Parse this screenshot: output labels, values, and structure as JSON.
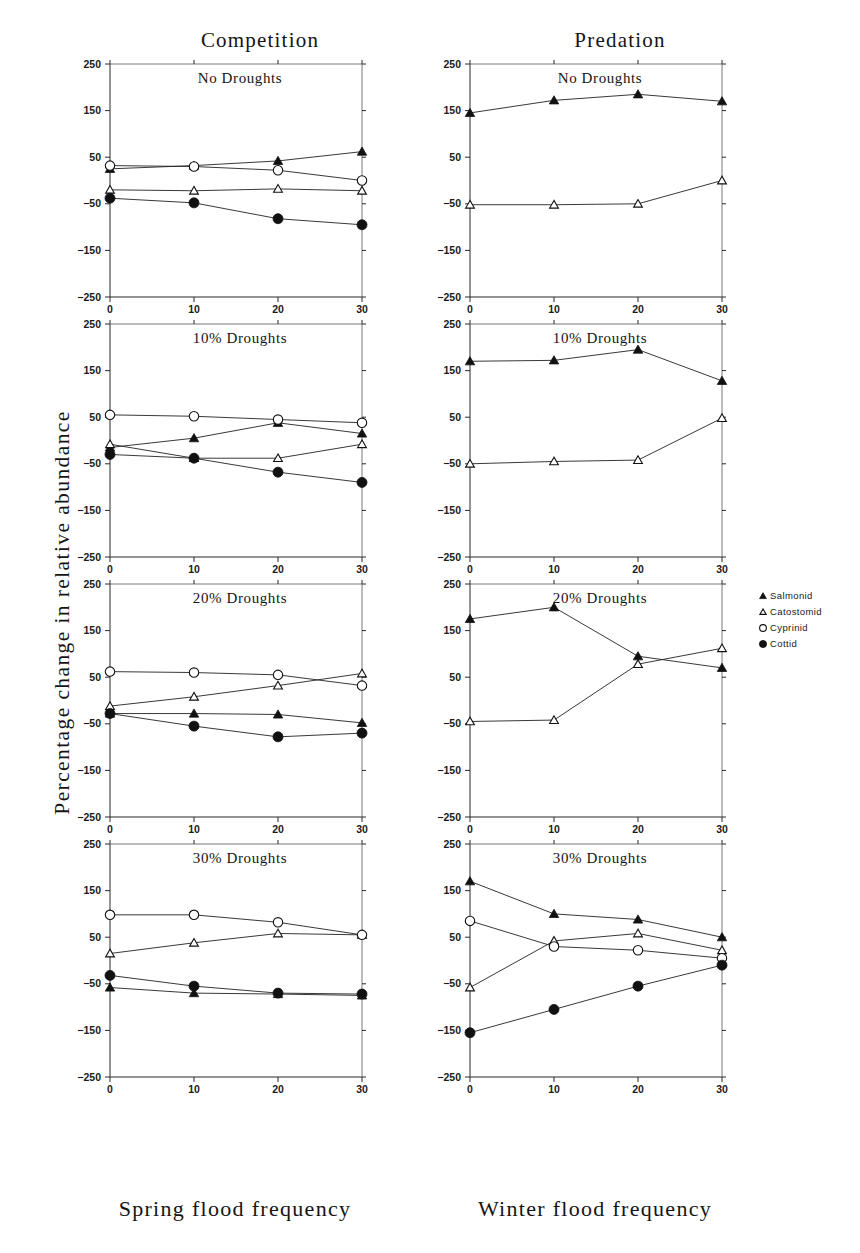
{
  "figure": {
    "y_axis_label": "Percentage change in relative abundance",
    "columns": [
      {
        "title": "Competition",
        "x_axis_label": "Spring flood frequency"
      },
      {
        "title": "Predation",
        "x_axis_label": "Winter flood frequency"
      }
    ]
  },
  "legend": {
    "position": "right-middle",
    "entries": [
      {
        "label": "Salmonid",
        "marker": "filled-triangle-icon"
      },
      {
        "label": "Catostomid",
        "marker": "open-triangle-icon"
      },
      {
        "label": "Cyprinid",
        "marker": "open-circle-icon"
      },
      {
        "label": "Cottid",
        "marker": "filled-circle-icon"
      }
    ]
  },
  "chart_data": [
    {
      "type": "line",
      "panel_id": "competition-no-droughts",
      "title": "No Droughts",
      "column": "Competition",
      "xlabel": "Spring flood frequency",
      "ylabel": "Percentage change in relative abundance",
      "x": [
        0,
        10,
        20,
        30
      ],
      "xlim": [
        0,
        30
      ],
      "ylim": [
        -250,
        250
      ],
      "xticks": [
        0,
        10,
        20,
        30
      ],
      "yticks": [
        -250,
        -150,
        -50,
        50,
        150,
        250
      ],
      "grid": false,
      "series": [
        {
          "name": "Salmonid",
          "marker": "filled-triangle",
          "values": [
            25,
            32,
            42,
            62
          ]
        },
        {
          "name": "Catostomid",
          "marker": "open-triangle",
          "values": [
            -20,
            -22,
            -18,
            -22
          ]
        },
        {
          "name": "Cyprinid",
          "marker": "open-circle",
          "values": [
            32,
            30,
            22,
            0
          ]
        },
        {
          "name": "Cottid",
          "marker": "filled-circle",
          "values": [
            -38,
            -48,
            -82,
            -95
          ]
        }
      ]
    },
    {
      "type": "line",
      "panel_id": "predation-no-droughts",
      "title": "No Droughts",
      "column": "Predation",
      "xlabel": "Winter flood frequency",
      "ylabel": "Percentage change in relative abundance",
      "x": [
        0,
        10,
        20,
        30
      ],
      "xlim": [
        0,
        30
      ],
      "ylim": [
        -250,
        250
      ],
      "xticks": [
        0,
        10,
        20,
        30
      ],
      "yticks": [
        -250,
        -150,
        -50,
        50,
        150,
        250
      ],
      "grid": false,
      "series": [
        {
          "name": "Salmonid",
          "marker": "filled-triangle",
          "values": [
            145,
            172,
            185,
            170
          ]
        },
        {
          "name": "Catostomid",
          "marker": "open-triangle",
          "values": [
            -52,
            -52,
            -50,
            0
          ]
        }
      ]
    },
    {
      "type": "line",
      "panel_id": "competition-10-droughts",
      "title": "10% Droughts",
      "column": "Competition",
      "xlabel": "Spring flood frequency",
      "ylabel": "Percentage change in relative abundance",
      "x": [
        0,
        10,
        20,
        30
      ],
      "xlim": [
        0,
        30
      ],
      "ylim": [
        -250,
        250
      ],
      "xticks": [
        0,
        10,
        20,
        30
      ],
      "yticks": [
        -250,
        -150,
        -50,
        50,
        150,
        250
      ],
      "grid": false,
      "series": [
        {
          "name": "Salmonid",
          "marker": "filled-triangle",
          "values": [
            -15,
            5,
            38,
            15
          ]
        },
        {
          "name": "Catostomid",
          "marker": "open-triangle",
          "values": [
            -8,
            -38,
            -38,
            -8
          ]
        },
        {
          "name": "Cyprinid",
          "marker": "open-circle",
          "values": [
            55,
            52,
            45,
            38
          ]
        },
        {
          "name": "Cottid",
          "marker": "filled-circle",
          "values": [
            -30,
            -38,
            -68,
            -90
          ]
        }
      ]
    },
    {
      "type": "line",
      "panel_id": "predation-10-droughts",
      "title": "10% Droughts",
      "column": "Predation",
      "xlabel": "Winter flood frequency",
      "ylabel": "Percentage change in relative abundance",
      "x": [
        0,
        10,
        20,
        30
      ],
      "xlim": [
        0,
        30
      ],
      "ylim": [
        -250,
        250
      ],
      "xticks": [
        0,
        10,
        20,
        30
      ],
      "yticks": [
        -250,
        -150,
        -50,
        50,
        150,
        250
      ],
      "grid": false,
      "series": [
        {
          "name": "Salmonid",
          "marker": "filled-triangle",
          "values": [
            170,
            172,
            195,
            128
          ]
        },
        {
          "name": "Catostomid",
          "marker": "open-triangle",
          "values": [
            -50,
            -45,
            -42,
            48
          ]
        }
      ]
    },
    {
      "type": "line",
      "panel_id": "competition-20-droughts",
      "title": "20% Droughts",
      "column": "Competition",
      "xlabel": "Spring flood frequency",
      "ylabel": "Percentage change in relative abundance",
      "x": [
        0,
        10,
        20,
        30
      ],
      "xlim": [
        0,
        30
      ],
      "ylim": [
        -250,
        250
      ],
      "xticks": [
        0,
        10,
        20,
        30
      ],
      "yticks": [
        -250,
        -150,
        -50,
        50,
        150,
        250
      ],
      "grid": false,
      "series": [
        {
          "name": "Salmonid",
          "marker": "filled-triangle",
          "values": [
            -28,
            -28,
            -30,
            -48
          ]
        },
        {
          "name": "Catostomid",
          "marker": "open-triangle",
          "values": [
            -12,
            8,
            32,
            58
          ]
        },
        {
          "name": "Cyprinid",
          "marker": "open-circle",
          "values": [
            62,
            60,
            55,
            32
          ]
        },
        {
          "name": "Cottid",
          "marker": "filled-circle",
          "values": [
            -28,
            -55,
            -78,
            -70
          ]
        }
      ]
    },
    {
      "type": "line",
      "panel_id": "predation-20-droughts",
      "title": "20% Droughts",
      "column": "Predation",
      "xlabel": "Winter flood frequency",
      "ylabel": "Percentage change in relative abundance",
      "x": [
        0,
        10,
        20,
        30
      ],
      "xlim": [
        0,
        30
      ],
      "ylim": [
        -250,
        250
      ],
      "xticks": [
        0,
        10,
        20,
        30
      ],
      "yticks": [
        -250,
        -150,
        -50,
        50,
        150,
        250
      ],
      "grid": false,
      "series": [
        {
          "name": "Salmonid",
          "marker": "filled-triangle",
          "values": [
            175,
            200,
            95,
            70
          ]
        },
        {
          "name": "Catostomid",
          "marker": "open-triangle",
          "values": [
            -45,
            -42,
            78,
            112
          ]
        }
      ]
    },
    {
      "type": "line",
      "panel_id": "competition-30-droughts",
      "title": "30% Droughts",
      "column": "Competition",
      "xlabel": "Spring flood frequency",
      "ylabel": "Percentage change in relative abundance",
      "x": [
        0,
        10,
        20,
        30
      ],
      "xlim": [
        0,
        30
      ],
      "ylim": [
        -250,
        250
      ],
      "xticks": [
        0,
        10,
        20,
        30
      ],
      "yticks": [
        -250,
        -150,
        -50,
        50,
        150,
        250
      ],
      "grid": false,
      "series": [
        {
          "name": "Salmonid",
          "marker": "filled-triangle",
          "values": [
            -58,
            -70,
            -72,
            -75
          ]
        },
        {
          "name": "Catostomid",
          "marker": "open-triangle",
          "values": [
            15,
            38,
            58,
            55
          ]
        },
        {
          "name": "Cyprinid",
          "marker": "open-circle",
          "values": [
            98,
            98,
            82,
            55
          ]
        },
        {
          "name": "Cottid",
          "marker": "filled-circle",
          "values": [
            -32,
            -55,
            -70,
            -72
          ]
        }
      ]
    },
    {
      "type": "line",
      "panel_id": "predation-30-droughts",
      "title": "30% Droughts",
      "column": "Predation",
      "xlabel": "Winter flood frequency",
      "ylabel": "Percentage change in relative abundance",
      "x": [
        0,
        10,
        20,
        30
      ],
      "xlim": [
        0,
        30
      ],
      "ylim": [
        -250,
        250
      ],
      "xticks": [
        0,
        10,
        20,
        30
      ],
      "yticks": [
        -250,
        -150,
        -50,
        50,
        150,
        250
      ],
      "grid": false,
      "series": [
        {
          "name": "Salmonid",
          "marker": "filled-triangle",
          "values": [
            170,
            100,
            88,
            50
          ]
        },
        {
          "name": "Catostomid",
          "marker": "open-triangle",
          "values": [
            -58,
            42,
            58,
            22
          ]
        },
        {
          "name": "Cyprinid",
          "marker": "open-circle",
          "values": [
            85,
            30,
            22,
            5
          ]
        },
        {
          "name": "Cottid",
          "marker": "filled-circle",
          "values": [
            -155,
            -105,
            -55,
            -10
          ]
        }
      ]
    }
  ]
}
